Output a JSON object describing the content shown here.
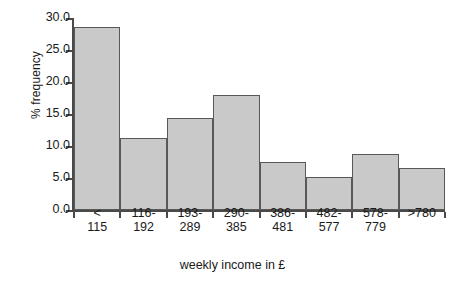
{
  "chart_data": {
    "type": "bar",
    "title": "",
    "subtitle": "",
    "xlabel": "weekly income in £",
    "ylabel": "% frequency",
    "categories": [
      "< 115",
      "116-192",
      "193-289",
      "290-385",
      "386-481",
      "482-577",
      "578-779",
      ">780"
    ],
    "category_lines": [
      [
        "<",
        "115"
      ],
      [
        "116-",
        "192"
      ],
      [
        "193-",
        "289"
      ],
      [
        "290-",
        "385"
      ],
      [
        "386-",
        "481"
      ],
      [
        "482-",
        "577"
      ],
      [
        "578-",
        "779"
      ],
      [
        ">780",
        ""
      ]
    ],
    "values": [
      28.6,
      11.2,
      14.3,
      17.9,
      7.5,
      5.1,
      8.7,
      6.5
    ],
    "ylim": [
      0.0,
      30.0
    ],
    "ytick_values": [
      0.0,
      5.0,
      10.0,
      15.0,
      20.0,
      25.0,
      30.0
    ],
    "ytick_labels": [
      "0.0",
      "5.0",
      "10.0",
      "15.0",
      "20.0",
      "25.0",
      "30.0"
    ],
    "grid": false,
    "legend": null,
    "bar_fill_color": "#c9c9c9",
    "bar_edge_color": "#585858",
    "axis_color": "#4a4a4a",
    "background_color": "#ffffff"
  }
}
